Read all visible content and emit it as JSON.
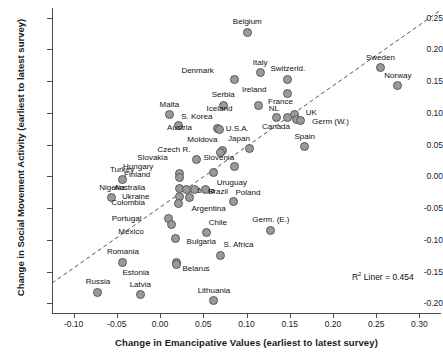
{
  "chart_data": {
    "type": "scatter",
    "title": "",
    "xlabel": "Change in Emancipative Values (earliest to latest survey)",
    "ylabel": "Change in Social Movement Activity (earliest to latest survey)",
    "xlim": [
      -0.125,
      0.325
    ],
    "ylim": [
      -0.215,
      0.265
    ],
    "xticks": [
      "-0.10",
      "-0.05",
      "0.00",
      "0.05",
      "0.10",
      "0.15",
      "0.20",
      "0.25",
      "0.30"
    ],
    "xtick_values": [
      -0.1,
      -0.05,
      0.0,
      0.05,
      0.1,
      0.15,
      0.2,
      0.25,
      0.3
    ],
    "yticks": [
      "0.25",
      "0.20",
      "0.15",
      "0.10",
      "0.05",
      "0.00",
      "-0.05",
      "-0.10",
      "-0.15",
      "-0.20"
    ],
    "ytick_values": [
      0.25,
      0.2,
      0.15,
      0.1,
      0.05,
      0.0,
      -0.05,
      -0.1,
      -0.15,
      -0.2
    ],
    "grid": false,
    "legend": false,
    "marker_color": "#9a9a9a",
    "marker_edge_color": "#5a5a5a",
    "trendline": {
      "style": "dashed",
      "color": "#555555",
      "x0": -0.125,
      "y0": -0.168,
      "x1": 0.325,
      "y1": 0.262
    },
    "annotation": {
      "text_prefix": "R",
      "text_sup": "2",
      "text_suffix": " Liner = 0.454",
      "x": 0.222,
      "y": -0.148
    },
    "points": [
      {
        "label": "Belgium",
        "x": 0.101,
        "y": 0.227,
        "lx": 0,
        "ly": -11
      },
      {
        "label": "Sweden",
        "x": 0.255,
        "y": 0.171,
        "lx": 0,
        "ly": -11
      },
      {
        "label": "Norway",
        "x": 0.275,
        "y": 0.143,
        "lx": 0,
        "ly": -11
      },
      {
        "label": "Italy",
        "x": 0.116,
        "y": 0.163,
        "lx": 0,
        "ly": -11
      },
      {
        "label": "Switzerld.",
        "x": 0.148,
        "y": 0.153,
        "lx": 0,
        "ly": -11
      },
      {
        "label": "Denmark",
        "x": 0.086,
        "y": 0.152,
        "lx": -25,
        "ly": -10
      },
      {
        "label": "Ireland",
        "x": 0.148,
        "y": 0.13,
        "lx": -26,
        "ly": -5
      },
      {
        "label": "France",
        "x": 0.155,
        "y": 0.098,
        "lx": -5,
        "ly": -13
      },
      {
        "label": "Serbia",
        "x": 0.073,
        "y": 0.112,
        "lx": 0,
        "ly": -11
      },
      {
        "label": "NL",
        "x": 0.135,
        "y": 0.093,
        "lx": -2,
        "ly": -9
      },
      {
        "label": "UK",
        "x": 0.158,
        "y": 0.09,
        "lx": 9,
        "ly": -7
      },
      {
        "label": "Germ (W.)",
        "x": 0.162,
        "y": 0.088,
        "lx": 12,
        "ly": 1
      },
      {
        "label": "Iceland",
        "x": 0.114,
        "y": 0.112,
        "lx": -30,
        "ly": 3
      },
      {
        "label": "Malta",
        "x": 0.011,
        "y": 0.097,
        "lx": 0,
        "ly": -11
      },
      {
        "label": "S. Korea",
        "x": 0.021,
        "y": 0.08,
        "lx": 3,
        "ly": -10
      },
      {
        "label": "Austria",
        "x": 0.066,
        "y": 0.075,
        "lx": -29,
        "ly": -2
      },
      {
        "label": "U.S.A.",
        "x": 0.069,
        "y": 0.074,
        "lx": 6,
        "ly": -1
      },
      {
        "label": "Canada",
        "x": 0.148,
        "y": 0.093,
        "lx": -2,
        "ly": 9
      },
      {
        "label": "Spain",
        "x": 0.167,
        "y": 0.047,
        "lx": 0,
        "ly": -11
      },
      {
        "label": "Japan",
        "x": 0.103,
        "y": 0.044,
        "lx": -3,
        "ly": -10
      },
      {
        "label": "Moldova",
        "x": 0.072,
        "y": 0.041,
        "lx": -9,
        "ly": -11
      },
      {
        "label": "Czech R.",
        "x": 0.07,
        "y": 0.038,
        "lx": -34,
        "ly": -3
      },
      {
        "label": "Slovenia",
        "x": 0.086,
        "y": 0.016,
        "lx": -4,
        "ly": -9
      },
      {
        "label": "Slovakia",
        "x": 0.042,
        "y": 0.026,
        "lx": -33,
        "ly": -3
      },
      {
        "label": "Hungary",
        "x": 0.022,
        "y": 0.004,
        "lx": -30,
        "ly": -8
      },
      {
        "label": "Finland",
        "x": 0.022,
        "y": -0.001,
        "lx": -33,
        "ly": -3
      },
      {
        "label": "Turkey",
        "x": -0.044,
        "y": -0.005,
        "lx": 0,
        "ly": -11
      },
      {
        "label": "Uruguay",
        "x": 0.062,
        "y": 0.006,
        "lx": 3,
        "ly": 9
      },
      {
        "label": "Nigeria",
        "x": -0.056,
        "y": -0.034,
        "lx": 0,
        "ly": -11
      },
      {
        "label": "Australia",
        "x": 0.022,
        "y": -0.019,
        "lx": -38,
        "ly": -1
      },
      {
        "label": "NZ",
        "x": 0.031,
        "y": -0.02,
        "lx": 3,
        "ly": 1
      },
      {
        "label": "India",
        "x": 0.04,
        "y": -0.02,
        "lx": 3,
        "ly": 1
      },
      {
        "label": "Brazil",
        "x": 0.052,
        "y": -0.021,
        "lx": 3,
        "ly": 1
      },
      {
        "label": "Poland",
        "x": 0.085,
        "y": -0.039,
        "lx": 2,
        "ly": -9
      },
      {
        "label": "Ukraine",
        "x": 0.023,
        "y": -0.032,
        "lx": -34,
        "ly": -1
      },
      {
        "label": "Colombia",
        "x": 0.021,
        "y": -0.042,
        "lx": -37,
        "ly": -1
      },
      {
        "label": "Argentina",
        "x": 0.034,
        "y": -0.034,
        "lx": 2,
        "ly": 10
      },
      {
        "label": "Chile",
        "x": 0.054,
        "y": -0.089,
        "lx": 2,
        "ly": -11
      },
      {
        "label": "Portugal",
        "x": 0.01,
        "y": -0.067,
        "lx": -31,
        "ly": -1
      },
      {
        "label": "Mexico",
        "x": 0.013,
        "y": -0.076,
        "lx": -32,
        "ly": 6
      },
      {
        "label": "Bulgaria",
        "x": 0.018,
        "y": -0.097,
        "lx": 11,
        "ly": 3
      },
      {
        "label": "Germ. (E.)",
        "x": 0.128,
        "y": -0.085,
        "lx": 0,
        "ly": -11
      },
      {
        "label": "S. Africa",
        "x": 0.07,
        "y": -0.124,
        "lx": 3,
        "ly": -11
      },
      {
        "label": "Romania",
        "x": -0.043,
        "y": -0.135,
        "lx": 0,
        "ly": -11
      },
      {
        "label": "Belarus",
        "x": 0.019,
        "y": -0.135,
        "lx": 6,
        "ly": 6
      },
      {
        "label": "Estonia",
        "x": 0.019,
        "y": -0.138,
        "lx": -31,
        "ly": 8
      },
      {
        "label": "Russia",
        "x": -0.072,
        "y": -0.182,
        "lx": 0,
        "ly": -11
      },
      {
        "label": "Latvia",
        "x": -0.023,
        "y": -0.186,
        "lx": 0,
        "ly": -11
      },
      {
        "label": "Lithuania",
        "x": 0.062,
        "y": -0.196,
        "lx": 0,
        "ly": -11
      }
    ]
  }
}
